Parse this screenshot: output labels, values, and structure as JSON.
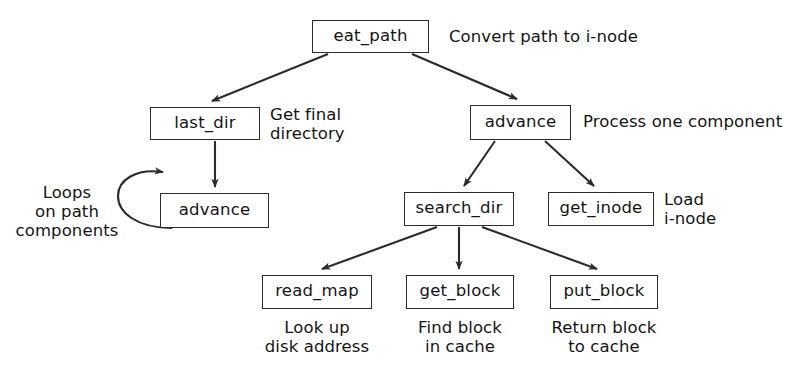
{
  "diagram": {
    "stroke_color": "#2b2b2b",
    "background_color": "#ffffff",
    "nodes": [
      {
        "id": "eat_path",
        "label": "eat_path",
        "x": 312,
        "y": 20,
        "w": 117,
        "h": 33
      },
      {
        "id": "last_dir",
        "label": "last_dir",
        "x": 150,
        "y": 107,
        "w": 110,
        "h": 33
      },
      {
        "id": "advance_r",
        "label": "advance",
        "x": 470,
        "y": 105,
        "w": 101,
        "h": 35
      },
      {
        "id": "advance_l",
        "label": "advance",
        "x": 160,
        "y": 193,
        "w": 109,
        "h": 35
      },
      {
        "id": "search_dir",
        "label": "search_dir",
        "x": 404,
        "y": 192,
        "w": 110,
        "h": 34
      },
      {
        "id": "get_inode",
        "label": "get_inode",
        "x": 548,
        "y": 192,
        "w": 106,
        "h": 34
      },
      {
        "id": "read_map",
        "label": "read_map",
        "x": 262,
        "y": 275,
        "w": 110,
        "h": 34
      },
      {
        "id": "get_block",
        "label": "get_block",
        "x": 406,
        "y": 275,
        "w": 108,
        "h": 34
      },
      {
        "id": "put_block",
        "label": "put_block",
        "x": 550,
        "y": 275,
        "w": 108,
        "h": 34
      }
    ],
    "annotations": [
      {
        "id": "annot-eat-path",
        "text": "Convert path to i-node",
        "x": 449,
        "y": 27,
        "align": "left"
      },
      {
        "id": "annot-last-dir",
        "text": "Get  final\ndirectory",
        "x": 270,
        "y": 105,
        "align": "left"
      },
      {
        "id": "annot-advance-r",
        "text": "Process one component",
        "x": 583,
        "y": 112,
        "align": "left"
      },
      {
        "id": "annot-loops",
        "text": "Loops\non path\ncomponents",
        "x": 8,
        "y": 183,
        "align": "center",
        "w": 118
      },
      {
        "id": "annot-get-inode",
        "text": "Load\ni-node",
        "x": 664,
        "y": 190,
        "align": "left"
      },
      {
        "id": "annot-read-map",
        "text": "Look up\ndisk address",
        "x": 252,
        "y": 318,
        "align": "center",
        "w": 130
      },
      {
        "id": "annot-get-block",
        "text": "Find block\nin cache",
        "x": 398,
        "y": 318,
        "align": "center",
        "w": 124
      },
      {
        "id": "annot-put-block",
        "text": "Return block\nto cache",
        "x": 538,
        "y": 318,
        "align": "center",
        "w": 132
      }
    ],
    "edges": [
      {
        "id": "edge-eat-path-to-last-dir",
        "from": "eat_path",
        "to": "last_dir",
        "kind": "diagonal"
      },
      {
        "id": "edge-eat-path-to-advance",
        "from": "eat_path",
        "to": "advance_r",
        "kind": "diagonal"
      },
      {
        "id": "edge-last-dir-to-advance",
        "from": "last_dir",
        "to": "advance_l",
        "kind": "vertical"
      },
      {
        "id": "edge-advance-self-loop",
        "from": "advance_l",
        "to": "advance_l",
        "kind": "self-loop"
      },
      {
        "id": "edge-advance-to-search-dir",
        "from": "advance_r",
        "to": "search_dir",
        "kind": "diagonal"
      },
      {
        "id": "edge-advance-to-get-inode",
        "from": "advance_r",
        "to": "get_inode",
        "kind": "diagonal"
      },
      {
        "id": "edge-search-dir-to-read-map",
        "from": "search_dir",
        "to": "read_map",
        "kind": "diagonal"
      },
      {
        "id": "edge-search-dir-to-get-block",
        "from": "search_dir",
        "to": "get_block",
        "kind": "vertical"
      },
      {
        "id": "edge-search-dir-to-put-block",
        "from": "search_dir",
        "to": "put_block",
        "kind": "diagonal"
      }
    ]
  }
}
